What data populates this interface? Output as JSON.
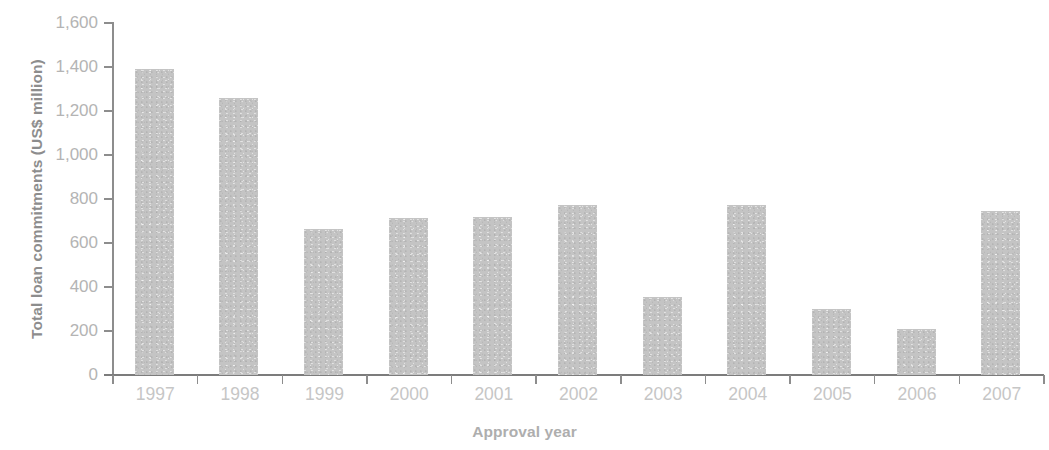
{
  "chart_data": {
    "type": "bar",
    "title": "",
    "subtitle": "",
    "xlabel": "Approval year",
    "ylabel": "Total loan commitments (US$ million)",
    "categories": [
      "1997",
      "1998",
      "1999",
      "2000",
      "2001",
      "2002",
      "2003",
      "2004",
      "2005",
      "2006",
      "2007"
    ],
    "values": [
      1390,
      1260,
      665,
      715,
      720,
      775,
      355,
      775,
      300,
      210,
      745
    ],
    "series": [
      {
        "name": "Total loan commitments",
        "values": [
          1390,
          1260,
          665,
          715,
          720,
          775,
          355,
          775,
          300,
          210,
          745
        ]
      }
    ],
    "ylim": [
      0,
      1600
    ],
    "ytick_values": [
      0,
      200,
      400,
      600,
      800,
      1000,
      1200,
      1400,
      1600
    ],
    "ytick_labels": [
      "0",
      "200",
      "400",
      "600",
      "800",
      "1,000",
      "1,200",
      "1,400",
      "1,600"
    ],
    "grid": false,
    "legend": null,
    "legend_position": "none",
    "annotations": [],
    "colors": {
      "bar_fill": "#c4c4c4",
      "axis_line": "#8d8d8d",
      "tick_label": "#bdbdbd",
      "axis_title": "#9e9e9e",
      "background": "#ffffff"
    }
  }
}
